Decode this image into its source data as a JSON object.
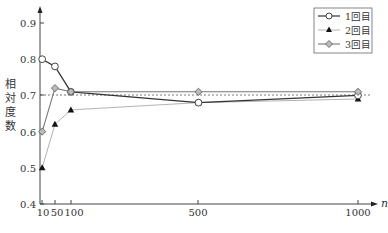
{
  "chart_data": {
    "type": "line",
    "title": "",
    "xlabel": "n",
    "ylabel": "相対度数",
    "x": [
      10,
      50,
      100,
      500,
      1000
    ],
    "x_tick_labels": [
      "10",
      "50",
      "100",
      "500",
      "1000"
    ],
    "y_tick_labels": [
      "0.4",
      "0.5",
      "0.6",
      "0.7",
      "0.8",
      "0.9"
    ],
    "ylim": [
      0.4,
      0.9
    ],
    "reference_line": {
      "y": 0.7,
      "style": "dashed"
    },
    "grid": false,
    "legend_position": "top-right",
    "series": [
      {
        "name": "1回目",
        "marker": "open-circle",
        "line_color": "#333333",
        "values": [
          0.8,
          0.78,
          0.71,
          0.68,
          0.7
        ]
      },
      {
        "name": "2回目",
        "marker": "filled-triangle",
        "line_color": "#aaaaaa",
        "values": [
          0.5,
          0.62,
          0.66,
          0.68,
          0.69
        ]
      },
      {
        "name": "3回目",
        "marker": "gray-diamond",
        "line_color": "#777777",
        "values": [
          0.6,
          0.72,
          0.71,
          0.71,
          0.71
        ]
      }
    ]
  },
  "legend": {
    "items": [
      {
        "label": "1回目"
      },
      {
        "label": "2回目"
      },
      {
        "label": "3回目"
      }
    ]
  },
  "axes": {
    "x_name": "n",
    "y_name_chars": [
      "相",
      "対",
      "度",
      "数"
    ]
  }
}
